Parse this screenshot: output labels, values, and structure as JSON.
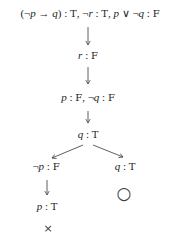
{
  "tableau": {
    "root": "(¬p → q) : T, ¬r : T, p ∨ ¬q : F",
    "step1": "r : F",
    "step2": "p : F, ¬q : F",
    "step3": "q : T",
    "left_branch": {
      "label": "¬p : F",
      "child": "p : T",
      "closed_marker": "×"
    },
    "right_branch": {
      "label": "q : T",
      "open_marker": "○"
    },
    "colors": {
      "ink": "#222222",
      "line": "#4d4d4d",
      "background": "#ffffff"
    }
  }
}
